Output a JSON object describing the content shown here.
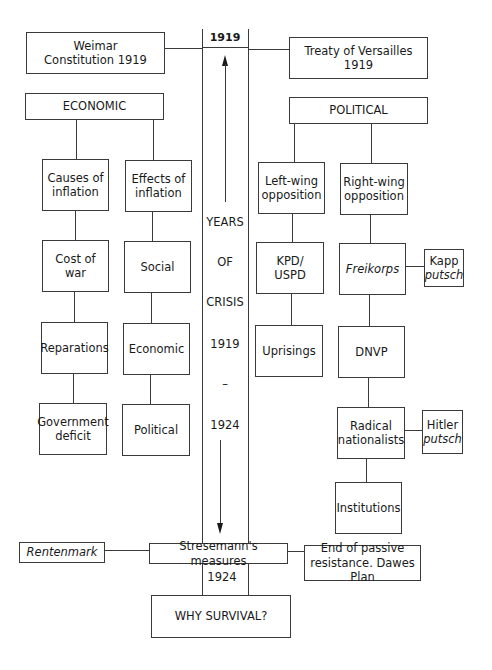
{
  "top": {
    "weimar": "Weimar Constitution 1919",
    "weimar_lines": [
      "Weimar",
      "Constitution 1919"
    ],
    "year_start": "1919",
    "versailles_lines": [
      "Treaty of Versailles",
      "1919"
    ]
  },
  "central_column": {
    "labels": [
      "YEARS",
      "OF",
      "CRISIS",
      "1919",
      "–",
      "1924"
    ],
    "year_end": "1924",
    "arrows": [
      "arrow-up",
      "arrow-down"
    ]
  },
  "economic": {
    "title": "ECONOMIC",
    "causes": {
      "header_lines": [
        "Causes of",
        "inflation"
      ],
      "items": [
        "Cost of war",
        "Reparations",
        "Government deficit"
      ],
      "gov_deficit_lines": [
        "Government",
        "deficit"
      ]
    },
    "effects": {
      "header_lines": [
        "Effects of",
        "inflation"
      ],
      "items": [
        "Social",
        "Economic",
        "Political"
      ]
    }
  },
  "political": {
    "title": "POLITICAL",
    "left_wing": {
      "header_lines": [
        "Left-wing",
        "opposition"
      ],
      "items": [
        "KPD/ USPD",
        "Uprisings"
      ],
      "kpd_lines": [
        "KPD/",
        "USPD"
      ]
    },
    "right_wing": {
      "header_lines": [
        "Right-wing",
        "opposition"
      ],
      "items": [
        "Freikorps",
        "DNVP",
        "Radical nationalists",
        "Institutions"
      ],
      "radical_lines": [
        "Radical",
        "nationalists"
      ],
      "side_items": {
        "kapp_lines": [
          "Kapp",
          "putsch"
        ],
        "hitler_lines": [
          "Hitler",
          "putsch"
        ]
      }
    }
  },
  "bottom": {
    "rentenmark": "Rentenmark",
    "stresemann": "Stresemann's measures",
    "end_passive_lines": [
      "End of passive",
      "resistance. Dawes Plan"
    ],
    "why_survival": "WHY SURVIVAL?"
  }
}
